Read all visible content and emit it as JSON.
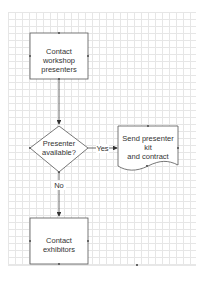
{
  "diagram": {
    "type": "flowchart",
    "nodes": [
      {
        "id": "contact_presenters",
        "shape": "process",
        "text": "Contact workshop presenters"
      },
      {
        "id": "presenter_available",
        "shape": "decision",
        "text": "Presenter available?"
      },
      {
        "id": "send_kit",
        "shape": "document",
        "text": "Send presenter kit and contract"
      },
      {
        "id": "contact_exhibitors",
        "shape": "process",
        "text": "Contact exhibitors"
      }
    ],
    "edges": [
      {
        "from": "contact_presenters",
        "to": "presenter_available",
        "label": ""
      },
      {
        "from": "presenter_available",
        "to": "send_kit",
        "label": "Yes"
      },
      {
        "from": "presenter_available",
        "to": "contact_exhibitors",
        "label": "No"
      }
    ],
    "labels": {
      "node1_line1": "Contact workshop",
      "node1_line2": "presenters",
      "node2_line1": "Presenter",
      "node2_line2": "available?",
      "node3_line1": "Send presenter kit",
      "node3_line2": "and contract",
      "node4": "Contact exhibitors",
      "edge_yes": "Yes",
      "edge_no": "No"
    },
    "colors": {
      "stroke": "#555555",
      "fill": "#ffffff",
      "grid_minor": "#e6e6e6",
      "grid_major": "#d2d2d2",
      "text": "#333333"
    }
  }
}
